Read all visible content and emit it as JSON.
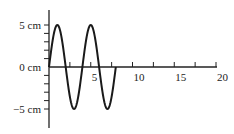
{
  "chart_data": {
    "type": "line",
    "title": "",
    "xlabel": "",
    "ylabel": "",
    "x_tick_labels": [
      "5",
      "10",
      "15",
      "20"
    ],
    "x_ticks": [
      2.5,
      5,
      7.5,
      10,
      12.5,
      15,
      17.5,
      20
    ],
    "y_tick_labels": [
      "5 cm",
      "0 cm",
      "−5 cm"
    ],
    "y_ticks": [
      5,
      4,
      3,
      2,
      1,
      0,
      -1,
      -2,
      -3,
      -4,
      -5
    ],
    "xlim": [
      0,
      20
    ],
    "ylim": [
      -7,
      7
    ],
    "grid": false,
    "series": [
      {
        "name": "wave",
        "function": "5*sin(2*pi*x/4)",
        "amplitude": 5,
        "period": 4,
        "x_start": 0,
        "x_end": 8,
        "x": [
          0,
          1,
          2,
          3,
          4,
          5,
          6,
          7,
          8
        ],
        "values": [
          0,
          5,
          0,
          -5,
          0,
          5,
          0,
          -5,
          0
        ]
      }
    ]
  },
  "colors": {
    "axis": "#222222",
    "curve": "#1a1a1a"
  }
}
